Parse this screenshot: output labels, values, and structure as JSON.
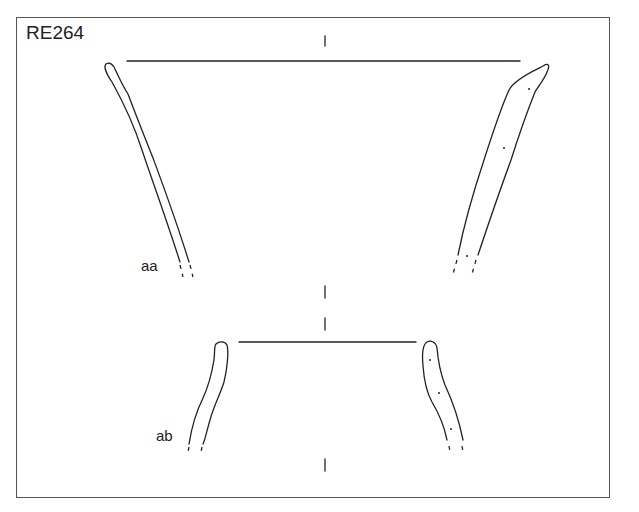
{
  "figure": {
    "id_label": "RE264",
    "sherds": [
      {
        "label": "aa",
        "description": "upper vessel profile, rim and flaring walls"
      },
      {
        "label": "ab",
        "description": "lower vessel profile, rim and walls"
      }
    ],
    "ink_color": "#222222",
    "background_color": "#ffffff"
  }
}
